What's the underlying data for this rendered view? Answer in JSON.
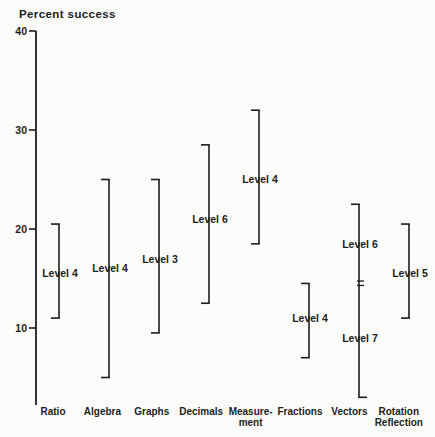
{
  "title": "Percent success",
  "colors": {
    "ink": "#1c1c1c",
    "background": "#fcfcfa"
  },
  "chart_data": {
    "type": "bar",
    "subtype": "vertical-range-brackets",
    "title": "Percent success",
    "ylabel": "Percent success",
    "xlabel": "",
    "ylim": [
      2,
      40
    ],
    "yticks": [
      10,
      20,
      30,
      40
    ],
    "grid": false,
    "legend": "none",
    "categories": [
      "Ratio",
      "Algebra",
      "Graphs",
      "Decimals",
      "Measurement",
      "Fractions",
      "Vectors",
      "Rotation Reflection"
    ],
    "bars": [
      {
        "category": "Ratio",
        "category_lines": [
          "Ratio"
        ],
        "min": 11,
        "max": 20.5,
        "cap_top": "left",
        "cap_bottom": "left",
        "labels": [
          {
            "text": "Level 4",
            "at": 15.5
          }
        ]
      },
      {
        "category": "Algebra",
        "category_lines": [
          "Algebra"
        ],
        "min": 5,
        "max": 25,
        "cap_top": "left",
        "cap_bottom": "left",
        "labels": [
          {
            "text": "Level 4",
            "at": 16
          }
        ]
      },
      {
        "category": "Graphs",
        "category_lines": [
          "Graphs"
        ],
        "min": 9.5,
        "max": 25,
        "cap_top": "left",
        "cap_bottom": "left",
        "labels": [
          {
            "text": "Level 3",
            "at": 17
          }
        ]
      },
      {
        "category": "Decimals",
        "category_lines": [
          "Decimals"
        ],
        "min": 12.5,
        "max": 28.5,
        "cap_top": "left",
        "cap_bottom": "left",
        "labels": [
          {
            "text": "Level 6",
            "at": 21
          }
        ]
      },
      {
        "category": "Measurement",
        "category_lines": [
          "Measure-",
          "ment"
        ],
        "min": 18.5,
        "max": 32,
        "cap_top": "left",
        "cap_bottom": "left",
        "labels": [
          {
            "text": "Level 4",
            "at": 25
          }
        ]
      },
      {
        "category": "Fractions",
        "category_lines": [
          "Fractions"
        ],
        "min": 7,
        "max": 14.5,
        "cap_top": "left",
        "cap_bottom": "left",
        "labels": [
          {
            "text": "Level 4",
            "at": 11
          }
        ]
      },
      {
        "category": "Vectors",
        "category_lines": [
          "Vectors"
        ],
        "min": 3,
        "max": 22.5,
        "cap_top": "left",
        "cap_bottom": "right",
        "break_at": 14.5,
        "labels": [
          {
            "text": "Level 6",
            "at": 18.5
          },
          {
            "text": "Level 7",
            "at": 9
          }
        ]
      },
      {
        "category": "Rotation Reflection",
        "category_lines": [
          "Rotation",
          "Reflection"
        ],
        "min": 11,
        "max": 20.5,
        "cap_top": "left",
        "cap_bottom": "left",
        "labels": [
          {
            "text": "Level 5",
            "at": 15.5
          }
        ]
      }
    ]
  }
}
